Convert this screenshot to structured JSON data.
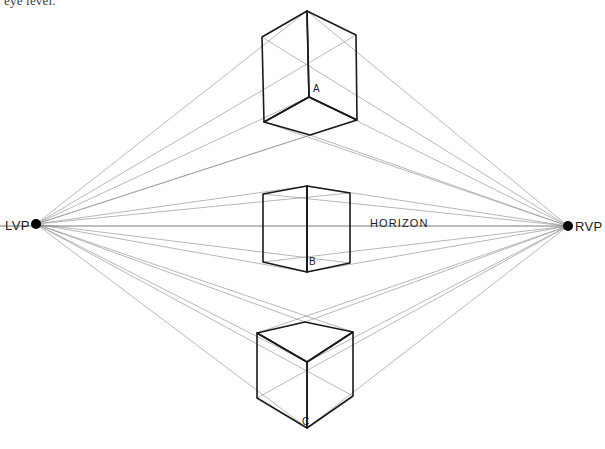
{
  "caption": {
    "text": "eye level."
  },
  "diagram": {
    "colors": {
      "background": "#ffffff",
      "cube_stroke": "#1a1a1a",
      "construction_line": "#9a9a9a",
      "horizon_line": "#7a7a7a",
      "vanishing_point": "#000000",
      "caption_text": "#3a3a3a"
    },
    "horizon": {
      "label": "HORIZON",
      "label_x": 370,
      "label_y": 227,
      "y": 226,
      "x_start": 0,
      "x_end": 568
    },
    "vanishing_points": [
      {
        "id": "lvp",
        "label": "LVP",
        "label_x": 5,
        "label_y": 230,
        "x": 36,
        "y": 224,
        "radius": 5
      },
      {
        "id": "rvp",
        "label": "RVP",
        "label_x": 575,
        "label_y": 231,
        "x": 568,
        "y": 226,
        "radius": 5
      }
    ],
    "cubes": [
      {
        "id": "cube-a",
        "label": "A",
        "label_x": 313,
        "label_y": 92,
        "position": "above-horizon",
        "visible_faces": [
          "left",
          "right",
          "bottom"
        ],
        "vertices": {
          "top_back": [
            307,
            11
          ],
          "top_left": [
            262,
            37
          ],
          "top_right": [
            356,
            35
          ],
          "center": [
            309,
            97
          ],
          "bottom_left": [
            264,
            122
          ],
          "bottom_right": [
            357,
            120
          ],
          "bottom_front": [
            310,
            135
          ]
        }
      },
      {
        "id": "cube-b",
        "label": "B",
        "label_x": 309,
        "label_y": 265,
        "position": "straddles-horizon",
        "visible_faces": [
          "left",
          "right"
        ],
        "vertices": {
          "top_back": [
            307,
            186
          ],
          "top_left": [
            263,
            194
          ],
          "top_right": [
            350,
            193
          ],
          "bottom_left": [
            263,
            262
          ],
          "bottom_right": [
            350,
            263
          ],
          "bottom_front": [
            307,
            272
          ]
        }
      },
      {
        "id": "cube-c",
        "label": "C",
        "label_x": 302,
        "label_y": 425,
        "position": "below-horizon",
        "visible_faces": [
          "top",
          "left",
          "right"
        ],
        "vertices": {
          "top_back": [
            305,
            322
          ],
          "top_left": [
            257,
            333
          ],
          "top_right": [
            353,
            332
          ],
          "center": [
            307,
            362
          ],
          "bottom_left": [
            257,
            398
          ],
          "bottom_right": [
            353,
            396
          ],
          "bottom_front": [
            307,
            428
          ]
        }
      }
    ],
    "construction_lines_from_lvp": [
      [
        307,
        11
      ],
      [
        356,
        35
      ],
      [
        309,
        97
      ],
      [
        357,
        120
      ],
      [
        310,
        135
      ],
      [
        307,
        186
      ],
      [
        350,
        193
      ],
      [
        350,
        263
      ],
      [
        307,
        272
      ],
      [
        305,
        322
      ],
      [
        353,
        332
      ],
      [
        307,
        362
      ],
      [
        353,
        396
      ],
      [
        307,
        428
      ]
    ],
    "construction_lines_from_rvp": [
      [
        307,
        11
      ],
      [
        262,
        37
      ],
      [
        309,
        97
      ],
      [
        264,
        122
      ],
      [
        310,
        135
      ],
      [
        307,
        186
      ],
      [
        263,
        194
      ],
      [
        263,
        262
      ],
      [
        307,
        272
      ],
      [
        305,
        322
      ],
      [
        257,
        333
      ],
      [
        307,
        362
      ],
      [
        257,
        398
      ],
      [
        307,
        428
      ]
    ]
  }
}
